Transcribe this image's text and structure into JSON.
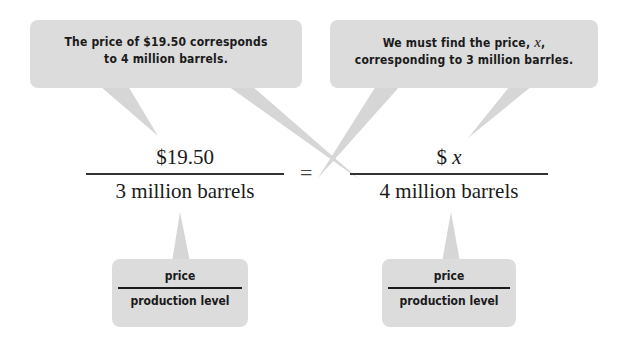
{
  "callouts": {
    "left": {
      "line1": "The price of $19.50 corresponds",
      "line2": "to 4 million barrels."
    },
    "right": {
      "line1_prefix": "We must find the price, ",
      "line1_var": "x",
      "line1_suffix": ",",
      "line2": "corresponding to 3 million barrles."
    }
  },
  "equation": {
    "left": {
      "numerator": "$19.50",
      "denominator": "3 million barrels"
    },
    "operator": "=",
    "right": {
      "numerator_prefix": "$ ",
      "numerator_var": "x",
      "denominator": "4 million barrels"
    }
  },
  "labels": {
    "left": {
      "numerator": "price",
      "denominator": "production level"
    },
    "right": {
      "numerator": "price",
      "denominator": "production level"
    }
  },
  "colors": {
    "bubble": "#dcdcdc",
    "text": "#1a1a1a"
  }
}
